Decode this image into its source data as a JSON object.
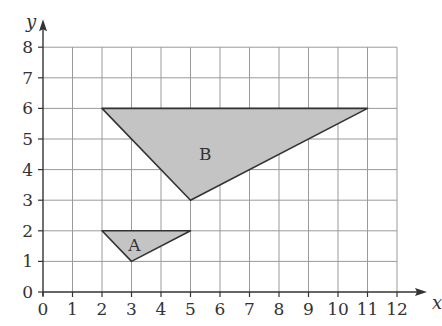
{
  "diagram": {
    "type": "coordinate-grid",
    "axes": {
      "x_label": "x",
      "y_label": "y",
      "x_ticks": [
        "0",
        "1",
        "2",
        "3",
        "4",
        "5",
        "6",
        "7",
        "8",
        "9",
        "10",
        "11",
        "12"
      ],
      "y_ticks": [
        "0",
        "1",
        "2",
        "3",
        "4",
        "5",
        "6",
        "7",
        "8"
      ],
      "x_range": [
        0,
        12
      ],
      "y_range": [
        0,
        8
      ]
    },
    "shapes": [
      {
        "label": "A",
        "vertices": [
          [
            2,
            2
          ],
          [
            5,
            2
          ],
          [
            3,
            1
          ]
        ],
        "fill": "#c4c4c4",
        "label_pos": [
          3.1,
          1.55
        ]
      },
      {
        "label": "B",
        "vertices": [
          [
            2,
            6
          ],
          [
            11,
            6
          ],
          [
            5,
            3
          ]
        ],
        "fill": "#c4c4c4",
        "label_pos": [
          5.5,
          4.5
        ]
      }
    ],
    "colors": {
      "grid": "#9a9a9a",
      "axis": "#333333",
      "shape_stroke": "#333333",
      "shape_fill": "#c4c4c4"
    }
  }
}
